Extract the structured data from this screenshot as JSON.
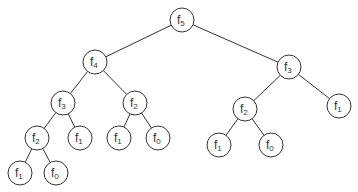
{
  "diagram": {
    "radius": 12,
    "stroke_color": "#333333",
    "nodes": [
      {
        "id": "n0",
        "base": "f",
        "sub": "5",
        "x": 182,
        "y": 20
      },
      {
        "id": "n1",
        "base": "f",
        "sub": "4",
        "x": 95,
        "y": 62
      },
      {
        "id": "n2",
        "base": "f",
        "sub": "3",
        "x": 289,
        "y": 67
      },
      {
        "id": "n3",
        "base": "f",
        "sub": "3",
        "x": 63,
        "y": 103
      },
      {
        "id": "n4",
        "base": "f",
        "sub": "2",
        "x": 135,
        "y": 103
      },
      {
        "id": "n5",
        "base": "f",
        "sub": "2",
        "x": 245,
        "y": 109
      },
      {
        "id": "n6",
        "base": "f",
        "sub": "1",
        "x": 339,
        "y": 106
      },
      {
        "id": "n7",
        "base": "f",
        "sub": "2",
        "x": 37,
        "y": 138
      },
      {
        "id": "n8",
        "base": "f",
        "sub": "1",
        "x": 80,
        "y": 138
      },
      {
        "id": "n9",
        "base": "f",
        "sub": "1",
        "x": 119,
        "y": 138
      },
      {
        "id": "n10",
        "base": "f",
        "sub": "0",
        "x": 158,
        "y": 138
      },
      {
        "id": "n11",
        "base": "f",
        "sub": "1",
        "x": 219,
        "y": 145
      },
      {
        "id": "n12",
        "base": "f",
        "sub": "0",
        "x": 271,
        "y": 145
      },
      {
        "id": "n13",
        "base": "f",
        "sub": "1",
        "x": 20,
        "y": 173
      },
      {
        "id": "n14",
        "base": "f",
        "sub": "0",
        "x": 56,
        "y": 173
      }
    ],
    "edges": [
      [
        "n0",
        "n1"
      ],
      [
        "n0",
        "n2"
      ],
      [
        "n1",
        "n3"
      ],
      [
        "n1",
        "n4"
      ],
      [
        "n2",
        "n5"
      ],
      [
        "n2",
        "n6"
      ],
      [
        "n3",
        "n7"
      ],
      [
        "n3",
        "n8"
      ],
      [
        "n4",
        "n9"
      ],
      [
        "n4",
        "n10"
      ],
      [
        "n5",
        "n11"
      ],
      [
        "n5",
        "n12"
      ],
      [
        "n7",
        "n13"
      ],
      [
        "n7",
        "n14"
      ]
    ]
  }
}
